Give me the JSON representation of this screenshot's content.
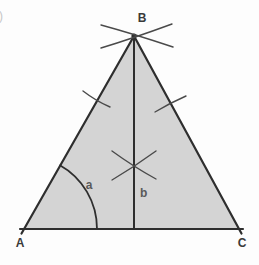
{
  "diagram": {
    "type": "geometry-construction",
    "vertex_labels": {
      "top": "B",
      "bottom_left": "A",
      "bottom_right": "C"
    },
    "angle_label": "a",
    "segment_label": "b",
    "edge_mark": ")",
    "colors": {
      "triangle_fill": "#d4d4d4",
      "edge_stroke": "#2e2e2e",
      "construction_stroke": "#4a4a4a",
      "vertex_label_color": "#3a3a3a",
      "small_label_color": "#5a5a5a",
      "background": "#fdfdfd"
    }
  }
}
